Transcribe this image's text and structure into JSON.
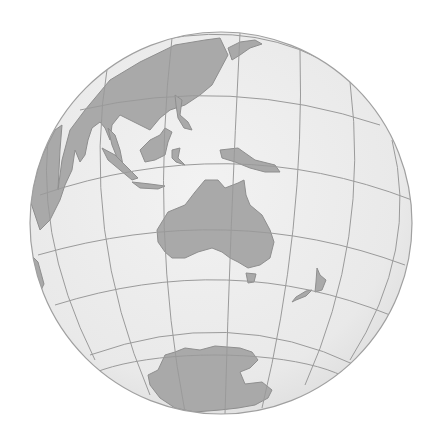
{
  "map": {
    "projection": "orthographic",
    "center_region": "Australia / Oceania",
    "background": "#ffffff",
    "colors": {
      "ocean": "#ececec",
      "ocean_edge": "#dcdcdc",
      "land": "#a9a9a9",
      "land_stroke": "#8e8e8e",
      "graticule": "#9a9a9a",
      "rim": "#a0a0a0"
    },
    "globe": {
      "cx": 221,
      "cy": 223,
      "r": 191
    },
    "landmasses": [
      {
        "name": "Asia",
        "label": "East & Southeast Asia"
      },
      {
        "name": "Indonesia",
        "label": "Indonesian archipelago"
      },
      {
        "name": "Borneo",
        "label": "Borneo"
      },
      {
        "name": "Philippines",
        "label": "Philippines"
      },
      {
        "name": "New Guinea",
        "label": "New Guinea"
      },
      {
        "name": "Australia",
        "label": "Australia"
      },
      {
        "name": "Tasmania",
        "label": "Tasmania"
      },
      {
        "name": "New Zealand",
        "label": "New Zealand"
      },
      {
        "name": "Antarctica",
        "label": "Antarctica"
      },
      {
        "name": "Japan",
        "label": "Japan"
      },
      {
        "name": "Africa edge",
        "label": "Madagascar / East Africa edge"
      }
    ]
  }
}
